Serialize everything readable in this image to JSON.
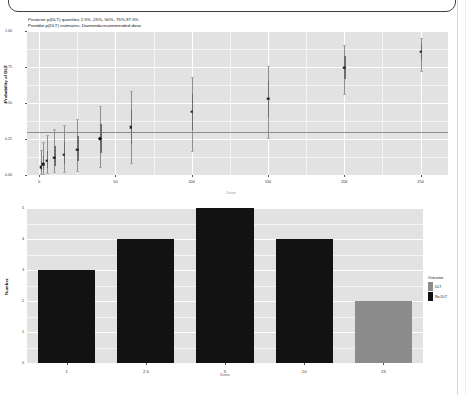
{
  "panel": {
    "frame_present": true
  },
  "chart_data": [
    {
      "id": "posterior-dlt-plot",
      "type": "scatter",
      "title": "",
      "subtitle_line1": "Posterior p(DLT) quantiles 2.5% ,25%, 50%, 75%,97.5%",
      "subtitle_line2": "Pointdot p(DLT) estimates; Diamond=recommended dose",
      "xlabel": "Dose",
      "ylabel": "Probability of DLT",
      "xlim": [
        -8,
        268
      ],
      "ylim": [
        0.0,
        1.0
      ],
      "xticks": [
        0,
        50,
        100,
        150,
        200,
        250
      ],
      "yticks": [
        0.0,
        0.25,
        0.5,
        0.75,
        1.0
      ],
      "ytick_labels": [
        "0.00",
        "0.25",
        "0.50",
        "0.75",
        "1.00"
      ],
      "grid": true,
      "panel_color": "#e2e2e2",
      "grid_color": "#ffffff",
      "reference_line_y": 0.3,
      "point_color": "#1b1b1b",
      "interval_color": "#8f8f8f",
      "points": [
        {
          "dose": 1,
          "median": 0.055,
          "lo": 0.005,
          "hi": 0.175,
          "q25": 0.025,
          "q75": 0.095,
          "recommended": false
        },
        {
          "dose": 2.5,
          "median": 0.075,
          "lo": 0.008,
          "hi": 0.23,
          "q25": 0.035,
          "q75": 0.13,
          "recommended": false
        },
        {
          "dose": 5,
          "median": 0.098,
          "lo": 0.012,
          "hi": 0.275,
          "q25": 0.048,
          "q75": 0.165,
          "recommended": false
        },
        {
          "dose": 10,
          "median": 0.12,
          "lo": 0.018,
          "hi": 0.32,
          "q25": 0.062,
          "q75": 0.2,
          "recommended": false
        },
        {
          "dose": 16,
          "median": 0.142,
          "lo": 0.022,
          "hi": 0.345,
          "q25": 0.078,
          "q75": 0.232,
          "recommended": false
        },
        {
          "dose": 25,
          "median": 0.175,
          "lo": 0.03,
          "hi": 0.39,
          "q25": 0.098,
          "q75": 0.268,
          "recommended": false
        },
        {
          "dose": 40,
          "median": 0.25,
          "lo": 0.055,
          "hi": 0.48,
          "q25": 0.15,
          "q75": 0.355,
          "recommended": true
        },
        {
          "dose": 60,
          "median": 0.33,
          "lo": 0.085,
          "hi": 0.58,
          "q25": 0.215,
          "q75": 0.45,
          "recommended": false
        },
        {
          "dose": 100,
          "median": 0.44,
          "lo": 0.165,
          "hi": 0.68,
          "q25": 0.31,
          "q75": 0.565,
          "recommended": false
        },
        {
          "dose": 150,
          "median": 0.53,
          "lo": 0.255,
          "hi": 0.76,
          "q25": 0.4,
          "q75": 0.65,
          "recommended": false
        },
        {
          "dose": 200,
          "median": 0.745,
          "lo": 0.56,
          "hi": 0.9,
          "q25": 0.665,
          "q75": 0.825,
          "recommended": false
        },
        {
          "dose": 250,
          "median": 0.855,
          "lo": 0.72,
          "hi": 0.95,
          "q25": 0.8,
          "q75": 0.91,
          "recommended": false
        }
      ]
    },
    {
      "id": "dose-outcome-barplot",
      "type": "bar",
      "title": "",
      "xlabel": "Dose",
      "ylabel": "Number",
      "categories": [
        "1",
        "2.5",
        "5",
        "10",
        "25"
      ],
      "values": [
        3,
        4,
        5,
        4,
        2
      ],
      "bar_outcomes": [
        "No DLT",
        "No DLT",
        "No DLT",
        "No DLT",
        "DLT"
      ],
      "ylim": [
        0,
        5
      ],
      "yticks": [
        0,
        1,
        2,
        3,
        4,
        5
      ],
      "grid": true,
      "panel_color": "#e2e2e2",
      "grid_color": "#ffffff",
      "legend_position": "right",
      "legend": {
        "title": "Outcome",
        "entries": [
          {
            "label": "DLT",
            "color": "#8c8c8c"
          },
          {
            "label": "No DLT",
            "color": "#121212"
          }
        ]
      }
    }
  ]
}
